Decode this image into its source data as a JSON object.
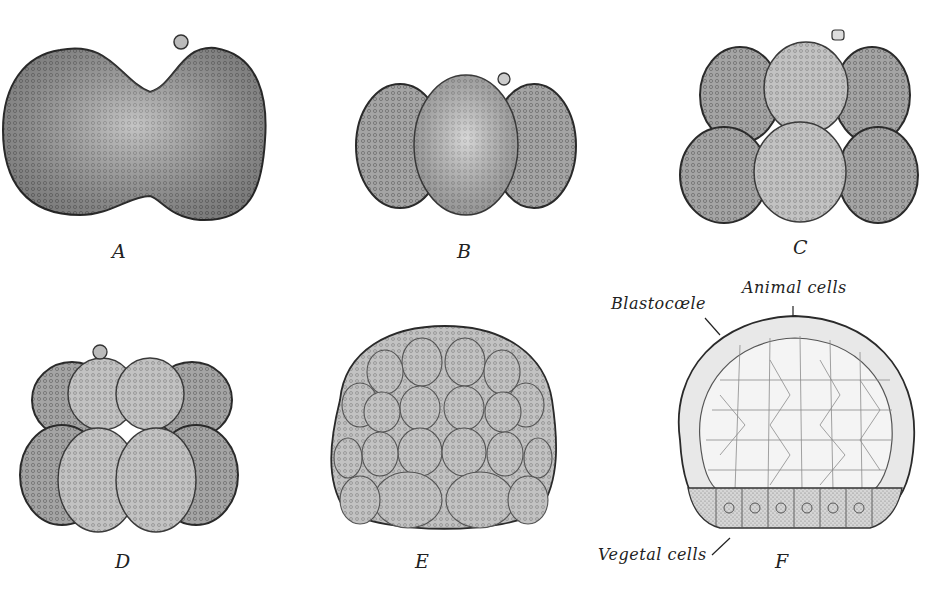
{
  "figure": {
    "panels": [
      {
        "id": "A",
        "label": "A",
        "description": "two-cell stage"
      },
      {
        "id": "B",
        "label": "B",
        "description": "four-cell stage"
      },
      {
        "id": "C",
        "label": "C",
        "description": "eight-cell stage"
      },
      {
        "id": "D",
        "label": "D",
        "description": "sixteen-cell stage"
      },
      {
        "id": "E",
        "label": "E",
        "description": "morula"
      },
      {
        "id": "F",
        "label": "F",
        "description": "blastula section"
      }
    ],
    "annotations": {
      "blastocoele": "Blastocœle",
      "animal_cells": "Animal cells",
      "vegetal_cells": "Vegetal cells"
    },
    "colors": {
      "cell_fill": "#9a9a9a",
      "cell_light": "#c9c9c9",
      "outline": "#2a2a2a",
      "background": "#ffffff"
    }
  }
}
